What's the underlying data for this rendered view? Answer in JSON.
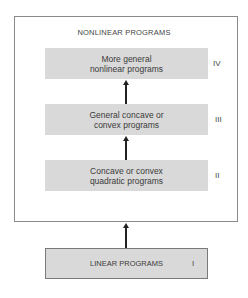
{
  "diagram": {
    "container": {
      "title": "NONLINEAR PROGRAMS"
    },
    "boxes": [
      {
        "id": "IV",
        "label": "More general\nnonlinear programs",
        "roman": "IV"
      },
      {
        "id": "III",
        "label": "General concave or\nconvex programs",
        "roman": "III"
      },
      {
        "id": "II",
        "label": "Concave or convex\nquadratic programs",
        "roman": "II"
      },
      {
        "id": "I",
        "label": "LINEAR PROGRAMS",
        "roman": "I"
      }
    ],
    "arrows": [
      {
        "from": "II",
        "to": "III"
      },
      {
        "from": "III",
        "to": "IV"
      },
      {
        "from": "I",
        "to": "NONLINEAR PROGRAMS"
      }
    ],
    "colors": {
      "box_fill": "#d9d9d9",
      "container_border": "#8a8a8a",
      "arrow": "#222222"
    }
  }
}
